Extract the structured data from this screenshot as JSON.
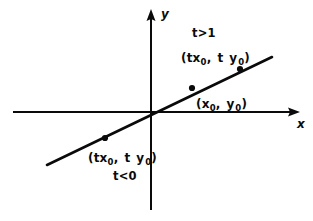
{
  "figure": {
    "type": "coordinate-diagram",
    "background_color": "#ffffff",
    "ink_color": "#0a0a0a",
    "axes": {
      "x_axis": {
        "label": "x",
        "arrow": "right",
        "y_pixel": 112,
        "x_start": 13,
        "x_end": 298
      },
      "y_axis": {
        "label": "y",
        "arrow": "up",
        "x_pixel": 151,
        "y_top": 10,
        "y_bottom": 210
      },
      "origin": {
        "x": 151,
        "y": 112
      }
    },
    "line": {
      "description": "straight line through the origin with positive slope",
      "x1": 47,
      "y1": 165,
      "x2": 272,
      "y2": 57
    },
    "points": [
      {
        "name": "point-t-negative",
        "label_text": "(tx",
        "label_sub1": "0",
        "label_mid": ", t y",
        "label_sub2": "0",
        "label_close": ")",
        "x": 105,
        "y": 138
      },
      {
        "name": "point-base",
        "label_text": "(x",
        "label_sub1": "0",
        "label_mid": ", y",
        "label_sub2": "0",
        "label_close": ")",
        "x": 192,
        "y": 88
      },
      {
        "name": "point-t-greater-than-one",
        "label_text": "(tx",
        "label_sub1": "0",
        "label_mid": ", t y",
        "label_sub2": "0",
        "label_close": ")",
        "x": 240,
        "y": 69
      }
    ],
    "conditions": {
      "upper": "t>1",
      "lower": "t<0"
    }
  }
}
